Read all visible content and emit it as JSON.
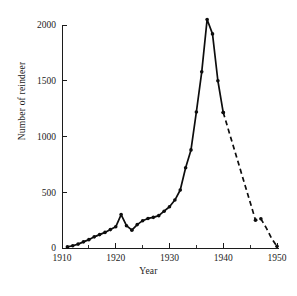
{
  "chart_data": {
    "type": "line",
    "title": "",
    "xlabel": "Year",
    "ylabel": "Number of reindeer",
    "xlim": [
      1910,
      1950
    ],
    "ylim": [
      0,
      2100
    ],
    "xticks": [
      1910,
      1920,
      1930,
      1940,
      1950
    ],
    "xtick_labels": [
      "1910",
      "1920",
      "1930",
      "1940",
      "1950"
    ],
    "xminorticks": [
      1915,
      1925,
      1935,
      1945
    ],
    "yticks": [
      0,
      500,
      1000,
      1500,
      2000
    ],
    "ytick_labels": [
      "0",
      "500",
      "1000",
      "1500",
      "2000"
    ],
    "grid": false,
    "legend": "none",
    "series": [
      {
        "name": "Number of reindeer",
        "style": "solid",
        "marker": "filled-circle",
        "x": [
          1911,
          1912,
          1913,
          1914,
          1915,
          1916,
          1917,
          1918,
          1919,
          1920,
          1921,
          1922,
          1923,
          1924,
          1925,
          1926,
          1927,
          1928,
          1929,
          1930,
          1931,
          1932,
          1933,
          1934,
          1935,
          1936,
          1937,
          1938,
          1939,
          1940
        ],
        "values": [
          10,
          20,
          35,
          55,
          75,
          100,
          120,
          140,
          165,
          190,
          300,
          200,
          160,
          210,
          245,
          265,
          275,
          290,
          330,
          370,
          430,
          520,
          720,
          880,
          1220,
          1580,
          2050,
          1920,
          1500,
          1215
        ]
      },
      {
        "name": "Number of reindeer (estimated)",
        "style": "dashed",
        "marker": "filled-circle",
        "x": [
          1940,
          1946,
          1947,
          1948,
          1949,
          1950
        ],
        "values": [
          1215,
          250,
          262,
          180,
          85,
          15
        ]
      }
    ],
    "annotations": [
      {
        "text": "peak population",
        "x": 1937,
        "y": 2050
      },
      {
        "text": "dashed segment denotes estimated counts",
        "x": 1943,
        "y": 700
      }
    ],
    "colors": {
      "line": "#0d0d0d",
      "axis": "#1c1c1c",
      "background": "#ffffff"
    }
  }
}
